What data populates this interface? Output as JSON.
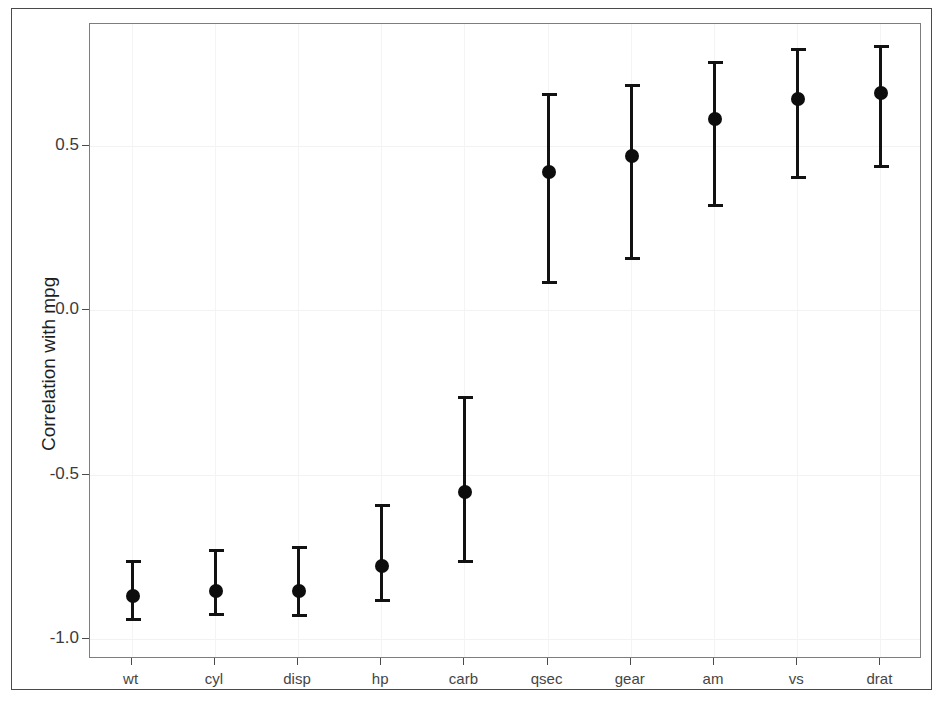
{
  "chart_data": {
    "type": "scatter",
    "title": "",
    "xlabel": "",
    "ylabel": "Correlation with mpg",
    "categories": [
      "wt",
      "cyl",
      "disp",
      "hp",
      "carb",
      "qsec",
      "gear",
      "am",
      "vs",
      "drat"
    ],
    "values": [
      -0.868,
      -0.852,
      -0.852,
      -0.776,
      -0.551,
      0.419,
      0.47,
      0.58,
      0.643,
      0.659
    ],
    "errors_low": [
      -0.943,
      -0.93,
      -0.932,
      -0.887,
      -0.768,
      0.081,
      0.153,
      0.315,
      0.399,
      0.432
    ],
    "errors_high": [
      -0.759,
      -0.727,
      -0.717,
      -0.59,
      -0.26,
      0.661,
      0.687,
      0.759,
      0.797,
      0.806
    ],
    "ylim": [
      -1.06,
      0.87
    ],
    "yticks": [
      0.5,
      0.0,
      -0.5,
      -1.0
    ],
    "ytick_labels": [
      "0.5",
      "0.0",
      "-0.5",
      "-1.0"
    ],
    "grid": true,
    "legend": "none",
    "marker": "filled-circle",
    "error_style": "capped-whisker"
  },
  "axes": {
    "y_title": "Correlation with mpg",
    "y_tick_labels": [
      "0.5",
      "0.0",
      "-0.5",
      "-1.0"
    ],
    "x_tick_labels": [
      "wt",
      "cyl",
      "disp",
      "hp",
      "carb",
      "qsec",
      "gear",
      "am",
      "vs",
      "drat"
    ]
  },
  "colors": {
    "marker": "#0d0d0d",
    "whisker": "#121212",
    "panel_border": "#7d7d7d",
    "outer_border": "#4a4a4a",
    "grid": "#f2f2f2",
    "background": "#ffffff",
    "tick_text": "#3b3b3b",
    "title_text": "#1e1e1e"
  }
}
